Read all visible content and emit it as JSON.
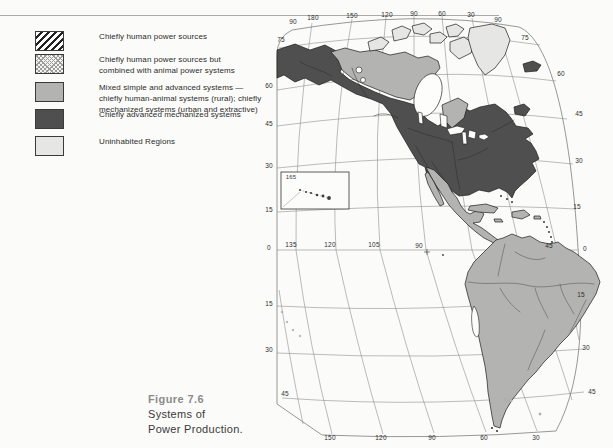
{
  "figure": {
    "caption_figure": "Figure 7.6",
    "caption_line1": "Systems of",
    "caption_line2": "Power Production."
  },
  "legend": {
    "items": [
      {
        "name": "chiefly-human-power",
        "pattern": "diagonal-hatch",
        "label": "Chiefly human power sources"
      },
      {
        "name": "human-animal-power",
        "pattern": "dot-mesh",
        "label": "Chiefly human power sources but\ncombined with animal power systems"
      },
      {
        "name": "mixed-systems",
        "pattern": "solid-medium-gray",
        "label": "Mixed simple and advanced systems —\nchiefly human-animal systems (rural); chiefly\nmechanized systems (urban and extractive)"
      },
      {
        "name": "advanced-mechanized",
        "pattern": "solid-dark-gray",
        "label": "Chiefly advanced mechanized systems"
      },
      {
        "name": "uninhabited",
        "pattern": "solid-light-gray",
        "label": "Uninhabited Regions"
      }
    ]
  },
  "map": {
    "projection_note": "",
    "inset_label": "165",
    "grid_labels": {
      "top": [
        "90",
        "180",
        "150",
        "120",
        "90",
        "60",
        "30",
        "90"
      ],
      "left": [
        "75",
        "60",
        "45",
        "30",
        "15",
        "0",
        "15",
        "30",
        "45"
      ],
      "right": [
        "75",
        "60",
        "45",
        "30",
        "15",
        "0",
        "15",
        "30",
        "45"
      ],
      "bottom": [
        "150",
        "120",
        "90",
        "60",
        "30"
      ],
      "equator": [
        "135",
        "120",
        "105",
        "90",
        "45"
      ]
    }
  },
  "colors": {
    "dark": "#4f4f4f",
    "medium": "#b3b3b1",
    "light": "#e6e6e4",
    "ocean": "#fdfdfb",
    "grid": "#8f8f8d",
    "background": "#fbfbf9"
  }
}
